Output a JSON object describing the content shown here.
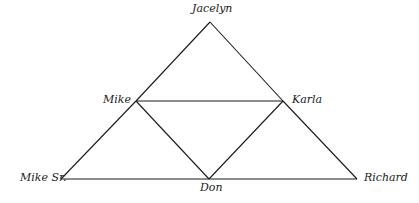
{
  "diagram": {
    "type": "family-triangle",
    "line_color": "#1a1a1a",
    "nodes": [
      {
        "id": "jacelyn",
        "label": "Jacelyn",
        "x": 210,
        "y": 22
      },
      {
        "id": "mike",
        "label": "Mike",
        "x": 136,
        "y": 101
      },
      {
        "id": "karla",
        "label": "Karla",
        "x": 283,
        "y": 101
      },
      {
        "id": "mike_sr",
        "label": "Mike Sr.",
        "x": 61,
        "y": 179
      },
      {
        "id": "don",
        "label": "Don",
        "x": 209,
        "y": 179
      },
      {
        "id": "richard",
        "label": "Richard",
        "x": 357,
        "y": 179
      }
    ],
    "edges": [
      [
        "jacelyn",
        "mike"
      ],
      [
        "jacelyn",
        "karla"
      ],
      [
        "mike",
        "karla"
      ],
      [
        "mike",
        "mike_sr"
      ],
      [
        "karla",
        "richard"
      ],
      [
        "mike_sr",
        "don"
      ],
      [
        "don",
        "richard"
      ],
      [
        "mike",
        "don"
      ],
      [
        "karla",
        "don"
      ]
    ]
  },
  "labels": {
    "jacelyn": "Jacelyn",
    "mike": "Mike",
    "karla": "Karla",
    "mike_sr": "Mike Sr.",
    "don": "Don",
    "richard": "Richard"
  }
}
